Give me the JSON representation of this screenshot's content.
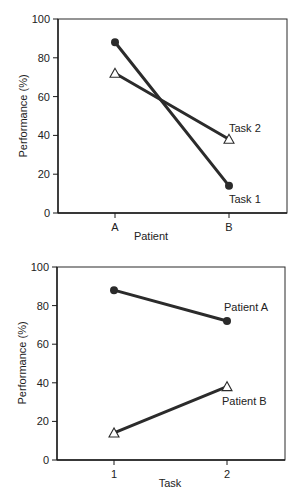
{
  "chart_data": [
    {
      "type": "line",
      "title": "",
      "xlabel": "Patient",
      "ylabel": "Performance (%)",
      "categories": [
        "A",
        "B"
      ],
      "ylim": [
        0,
        100
      ],
      "yticks": [
        0,
        20,
        40,
        60,
        80,
        100
      ],
      "grid": false,
      "legend": "inline labels at line ends",
      "series": [
        {
          "name": "Task 1",
          "marker": "filled-circle",
          "values": [
            88,
            14
          ]
        },
        {
          "name": "Task 2",
          "marker": "open-triangle",
          "values": [
            72,
            38
          ]
        }
      ]
    },
    {
      "type": "line",
      "title": "",
      "xlabel": "Task",
      "ylabel": "Performance (%)",
      "categories": [
        "1",
        "2"
      ],
      "ylim": [
        0,
        100
      ],
      "yticks": [
        0,
        20,
        40,
        60,
        80,
        100
      ],
      "grid": false,
      "legend": "inline labels at line ends",
      "series": [
        {
          "name": "Patient A",
          "marker": "filled-circle",
          "values": [
            88,
            72
          ]
        },
        {
          "name": "Patient B",
          "marker": "open-triangle",
          "values": [
            14,
            38
          ]
        }
      ]
    }
  ],
  "charts": {
    "top": {
      "xlabel": "Patient",
      "ylabel": "Performance (%)",
      "xticks": [
        "A",
        "B"
      ],
      "yticks": [
        "0",
        "20",
        "40",
        "60",
        "80",
        "100"
      ],
      "series_labels": [
        "Task 1",
        "Task 2"
      ]
    },
    "bottom": {
      "xlabel": "Task",
      "ylabel": "Performance (%)",
      "xticks": [
        "1",
        "2"
      ],
      "yticks": [
        "0",
        "20",
        "40",
        "60",
        "80",
        "100"
      ],
      "series_labels": [
        "Patient A",
        "Patient B"
      ]
    }
  }
}
